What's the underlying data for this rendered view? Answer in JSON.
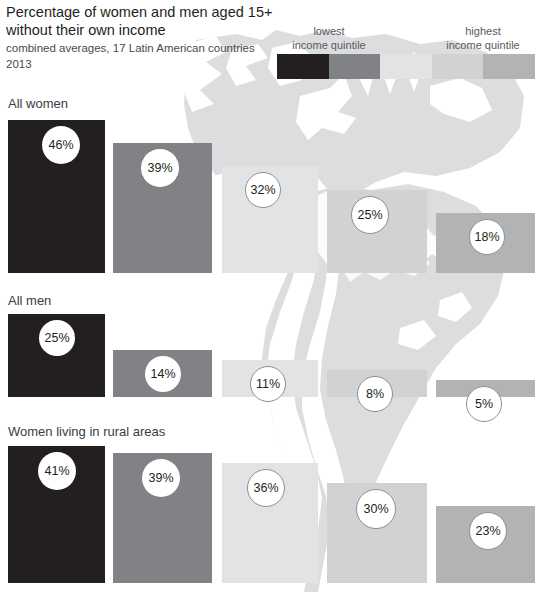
{
  "header": {
    "title_line1": "Percentage of women and men aged 15+",
    "title_line2": "without their own income",
    "subtitle": "combined averages, 17 Latin American countries",
    "year": "2013"
  },
  "legend": {
    "low_line1": "lowest",
    "low_line2": "income quintile",
    "high_line1": "highest",
    "high_line2": "income quintile",
    "colors": [
      "#231f20",
      "#808285",
      "#e2e3e4",
      "#d0d2d3",
      "#b1b3b5"
    ]
  },
  "map": {
    "fill": "#dcdddf",
    "name": "latin-america-map"
  },
  "chart_data": {
    "type": "bar",
    "title": "Percentage of women and men aged 15+ without their own income",
    "subtitle": "combined averages, 17 Latin American countries",
    "year": "2013",
    "xlabel": "income quintile",
    "ylabel": "percentage without own income",
    "categories": [
      "lowest income quintile",
      "2nd quintile",
      "3rd quintile",
      "4th quintile",
      "highest income quintile"
    ],
    "quintile_colors": [
      "#231f20",
      "#808285",
      "#e2e3e4",
      "#d0d2d3",
      "#b1b3b5"
    ],
    "ylim": [
      0,
      50
    ],
    "grid": false,
    "legend_position": "top-right",
    "series": [
      {
        "name": "All women",
        "values": [
          46,
          39,
          32,
          25,
          18
        ],
        "labels": [
          "46%",
          "39%",
          "32%",
          "25%",
          "18%"
        ]
      },
      {
        "name": "All men",
        "values": [
          25,
          14,
          11,
          8,
          5
        ],
        "labels": [
          "25%",
          "14%",
          "11%",
          "8%",
          "5%"
        ]
      },
      {
        "name": "Women living in rural areas",
        "values": [
          41,
          39,
          36,
          30,
          23
        ],
        "labels": [
          "41%",
          "39%",
          "36%",
          "30%",
          "23%"
        ]
      }
    ]
  }
}
